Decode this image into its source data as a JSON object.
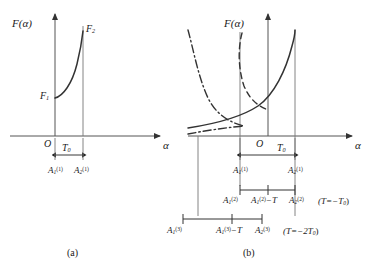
{
  "figure": {
    "panels": [
      {
        "id": "a",
        "caption": "(a)",
        "axis_y_label": "F(α)",
        "axis_x_label": "α",
        "origin_label": "O",
        "curve_labels": [
          "F₁",
          "F₂"
        ],
        "interval_label": "T₀",
        "tick_labels": [
          "A₁⁽¹⁾",
          "A₂⁽¹⁾"
        ]
      },
      {
        "id": "b",
        "caption": "(b)",
        "axis_y_label": "F(α)",
        "axis_x_label": "α",
        "origin_label": "O",
        "interval_label": "T₀",
        "row1_labels": [
          "A₁⁽¹⁾",
          "A₂⁽¹⁾"
        ],
        "row2_labels": [
          "A₁⁽²⁾",
          "A₁⁽²⁾−T",
          "A₂⁽²⁾"
        ],
        "row2_condition": "(T=−T₀)",
        "row3_labels": [
          "A₁⁽³⁾",
          "A₁⁽³⁾−T",
          "A₂⁽³⁾"
        ],
        "row3_condition": "(T=−2T₀)"
      }
    ],
    "text": {
      "F_alpha": "F(α)",
      "alpha": "α",
      "O": "O",
      "F1_base": "F",
      "F1_sub": "1",
      "F2_base": "F",
      "F2_sub": "2",
      "T_base": "T",
      "T_sub": "0",
      "A_base": "A",
      "sub1": "1",
      "sub2": "2",
      "sup1": "(1)",
      "sup2": "(2)",
      "sup3": "(3)",
      "minus_T": "−T",
      "cond_T1": "(T=−T",
      "cond_T1_end": ")",
      "cond_T2": "(T=−2T",
      "cond_T2_end": ")",
      "cond_sub": "0",
      "caption_a": "(a)",
      "caption_b": "(b)"
    },
    "colors": {
      "ink": "#1a1a1a",
      "line": "#555555",
      "background": "#ffffff"
    }
  }
}
